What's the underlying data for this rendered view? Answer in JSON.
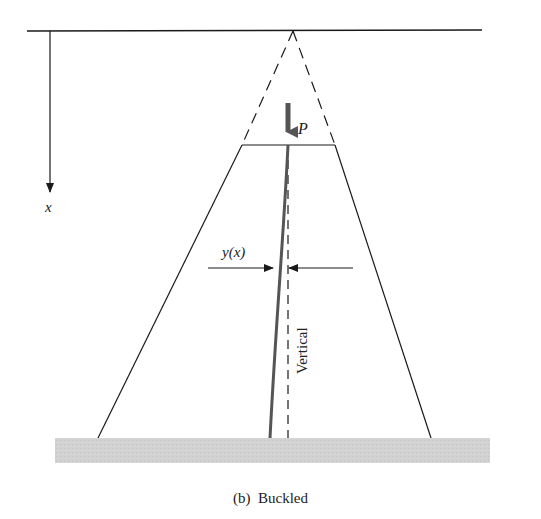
{
  "figure": {
    "caption": "(b)  Buckled",
    "labels": {
      "load": "P",
      "axis": "x",
      "deflection": "y(x)",
      "vertical": "Vertical"
    },
    "colors": {
      "line": "#1a1a1a",
      "column": "#555555",
      "ground": "#cfcfcf",
      "load_arrow": "#555555"
    }
  }
}
